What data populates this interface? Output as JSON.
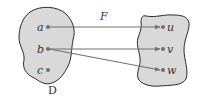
{
  "diagram": {
    "type": "function-mapping",
    "function_label": "F",
    "domain_set": {
      "label": "D",
      "elements": [
        "a",
        "b",
        "c"
      ]
    },
    "codomain_set": {
      "elements": [
        "u",
        "v",
        "w"
      ]
    },
    "mappings": [
      {
        "from": "a",
        "to": "u"
      },
      {
        "from": "b",
        "to": "v"
      },
      {
        "from": "b",
        "to": "w"
      }
    ],
    "colors": {
      "blob_fill": "#d9d9d9",
      "blob_stroke": "#2b2b2b",
      "arrow": "#707070",
      "dot": "#707070",
      "text": "#333333"
    }
  }
}
